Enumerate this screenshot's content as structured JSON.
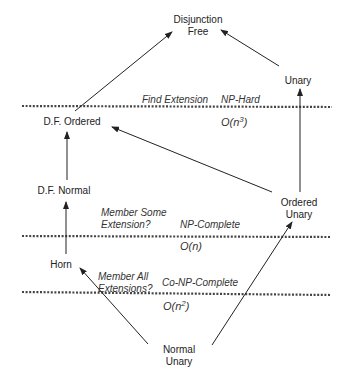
{
  "diagram": {
    "nodes": {
      "disjunction_free": {
        "line1": "Disjunction",
        "line2": "Free"
      },
      "unary": {
        "label": "Unary"
      },
      "df_ordered": {
        "label": "D.F. Ordered"
      },
      "df_normal": {
        "label": "D.F. Normal"
      },
      "ordered_unary": {
        "line1": "Ordered",
        "line2": "Unary"
      },
      "horn": {
        "label": "Horn"
      },
      "normal_unary": {
        "line1": "Normal",
        "line2": "Unary"
      }
    },
    "boundaries": [
      {
        "problem": "Find Extension",
        "hardness": "NP-Hard",
        "complexity_base": "O(n",
        "complexity_exp": "3",
        "complexity_end": ")"
      },
      {
        "problem_line1": "Member Some",
        "problem_line2": "Extension?",
        "hardness": "NP-Complete",
        "complexity": "O(n)"
      },
      {
        "problem_line1": "Member All",
        "problem_line2": "Extensions?",
        "hardness": "Co-NP-Complete",
        "complexity_base": "O(n",
        "complexity_exp": "2",
        "complexity_end": ")"
      }
    ],
    "edges": [
      {
        "from": "D.F. Ordered",
        "to": "Disjunction Free"
      },
      {
        "from": "Unary",
        "to": "Disjunction Free"
      },
      {
        "from": "D.F. Normal",
        "to": "D.F. Ordered"
      },
      {
        "from": "Ordered Unary",
        "to": "D.F. Ordered"
      },
      {
        "from": "Ordered Unary",
        "to": "Unary"
      },
      {
        "from": "Horn",
        "to": "D.F. Normal"
      },
      {
        "from": "Normal Unary",
        "to": "Horn"
      },
      {
        "from": "Normal Unary",
        "to": "Ordered Unary"
      }
    ],
    "colors": {
      "line": "#222222",
      "dotted": "#444444",
      "text": "#222222"
    }
  }
}
